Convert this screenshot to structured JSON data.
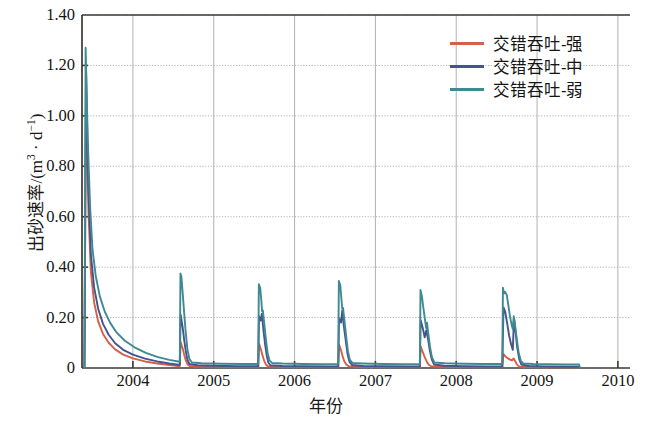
{
  "chart_data": {
    "type": "line",
    "title": "",
    "xlabel": "年份",
    "ylabel": "出砂速率/(m³ · d⁻¹)",
    "ylabel_parts": {
      "name": "出砂速率",
      "slash": "/(m",
      "sup1": "3",
      "mid": " · d",
      "sup2": "−1",
      "close": ")"
    },
    "xlim": [
      2003.37,
      2010.15
    ],
    "ylim": [
      0,
      1.4
    ],
    "yticks": [
      0,
      0.2,
      0.4,
      0.6,
      0.8,
      1.0,
      1.2,
      1.4
    ],
    "ytick_labels": [
      "0",
      "0.20",
      "0.40",
      "0.60",
      "0.80",
      "1.00",
      "1.20",
      "1.40"
    ],
    "xticks": [
      2004,
      2005,
      2006,
      2007,
      2008,
      2009,
      2010
    ],
    "xtick_labels": [
      "2004",
      "2005",
      "2006",
      "2007",
      "2008",
      "2009",
      "2010"
    ],
    "grid": true,
    "grid_color": "#a8a8a8",
    "legend_position": "top-right",
    "colors": {
      "strong": "#d4604a",
      "medium": "#45548c",
      "weak": "#3f8a92"
    },
    "series": [
      {
        "name": "交错吞吐-强",
        "color": "#d4604a",
        "points": [
          [
            2003.4,
            0.0
          ],
          [
            2003.42,
            1.1
          ],
          [
            2003.45,
            0.62
          ],
          [
            2003.48,
            0.38
          ],
          [
            2003.52,
            0.26
          ],
          [
            2003.57,
            0.185
          ],
          [
            2003.63,
            0.135
          ],
          [
            2003.7,
            0.1
          ],
          [
            2003.78,
            0.074
          ],
          [
            2003.88,
            0.053
          ],
          [
            2004.0,
            0.038
          ],
          [
            2004.15,
            0.026
          ],
          [
            2004.3,
            0.018
          ],
          [
            2004.45,
            0.012
          ],
          [
            2004.56,
            0.008
          ],
          [
            2004.58,
            0.008
          ],
          [
            2004.59,
            0.103
          ],
          [
            2004.615,
            0.078
          ],
          [
            2004.635,
            0.052
          ],
          [
            2004.655,
            0.03
          ],
          [
            2004.675,
            0.015
          ],
          [
            2004.7,
            0.008
          ],
          [
            2004.8,
            0.006
          ],
          [
            2005.0,
            0.005
          ],
          [
            2005.3,
            0.004
          ],
          [
            2005.53,
            0.004
          ],
          [
            2005.55,
            0.004
          ],
          [
            2005.56,
            0.096
          ],
          [
            2005.585,
            0.072
          ],
          [
            2005.605,
            0.048
          ],
          [
            2005.625,
            0.028
          ],
          [
            2005.645,
            0.014
          ],
          [
            2005.67,
            0.007
          ],
          [
            2005.8,
            0.005
          ],
          [
            2006.1,
            0.004
          ],
          [
            2006.4,
            0.004
          ],
          [
            2006.52,
            0.004
          ],
          [
            2006.54,
            0.004
          ],
          [
            2006.55,
            0.092
          ],
          [
            2006.575,
            0.07
          ],
          [
            2006.595,
            0.046
          ],
          [
            2006.615,
            0.027
          ],
          [
            2006.64,
            0.014
          ],
          [
            2006.67,
            0.007
          ],
          [
            2006.8,
            0.005
          ],
          [
            2007.1,
            0.004
          ],
          [
            2007.4,
            0.004
          ],
          [
            2007.53,
            0.004
          ],
          [
            2007.55,
            0.004
          ],
          [
            2007.56,
            0.085
          ],
          [
            2007.585,
            0.064
          ],
          [
            2007.61,
            0.043
          ],
          [
            2007.635,
            0.026
          ],
          [
            2007.66,
            0.013
          ],
          [
            2007.69,
            0.007
          ],
          [
            2007.85,
            0.005
          ],
          [
            2008.1,
            0.004
          ],
          [
            2008.4,
            0.004
          ],
          [
            2008.55,
            0.004
          ],
          [
            2008.57,
            0.004
          ],
          [
            2008.585,
            0.055
          ],
          [
            2008.61,
            0.046
          ],
          [
            2008.64,
            0.038
          ],
          [
            2008.665,
            0.033
          ],
          [
            2008.69,
            0.03
          ],
          [
            2008.71,
            0.038
          ],
          [
            2008.725,
            0.03
          ],
          [
            2008.745,
            0.018
          ],
          [
            2008.765,
            0.009
          ],
          [
            2008.79,
            0.005
          ],
          [
            2008.9,
            0.004
          ],
          [
            2009.1,
            0.003
          ],
          [
            2009.4,
            0.003
          ],
          [
            2009.52,
            0.003
          ],
          [
            2009.53,
            0.0
          ]
        ]
      },
      {
        "name": "交错吞吐-中",
        "color": "#45548c",
        "points": [
          [
            2003.4,
            0.0
          ],
          [
            2003.42,
            1.18
          ],
          [
            2003.45,
            0.7
          ],
          [
            2003.48,
            0.45
          ],
          [
            2003.52,
            0.32
          ],
          [
            2003.57,
            0.235
          ],
          [
            2003.63,
            0.175
          ],
          [
            2003.7,
            0.132
          ],
          [
            2003.78,
            0.098
          ],
          [
            2003.88,
            0.072
          ],
          [
            2004.0,
            0.053
          ],
          [
            2004.15,
            0.037
          ],
          [
            2004.3,
            0.026
          ],
          [
            2004.45,
            0.018
          ],
          [
            2004.56,
            0.013
          ],
          [
            2004.58,
            0.013
          ],
          [
            2004.59,
            0.212
          ],
          [
            2004.615,
            0.162
          ],
          [
            2004.635,
            0.11
          ],
          [
            2004.655,
            0.065
          ],
          [
            2004.675,
            0.032
          ],
          [
            2004.7,
            0.016
          ],
          [
            2004.8,
            0.011
          ],
          [
            2005.0,
            0.009
          ],
          [
            2005.3,
            0.007
          ],
          [
            2005.53,
            0.007
          ],
          [
            2005.55,
            0.007
          ],
          [
            2005.56,
            0.205
          ],
          [
            2005.58,
            0.188
          ],
          [
            2005.595,
            0.215
          ],
          [
            2005.615,
            0.15
          ],
          [
            2005.635,
            0.095
          ],
          [
            2005.655,
            0.05
          ],
          [
            2005.675,
            0.022
          ],
          [
            2005.7,
            0.011
          ],
          [
            2005.85,
            0.008
          ],
          [
            2006.1,
            0.007
          ],
          [
            2006.4,
            0.006
          ],
          [
            2006.52,
            0.006
          ],
          [
            2006.54,
            0.006
          ],
          [
            2006.55,
            0.198
          ],
          [
            2006.575,
            0.18
          ],
          [
            2006.59,
            0.228
          ],
          [
            2006.61,
            0.165
          ],
          [
            2006.635,
            0.105
          ],
          [
            2006.655,
            0.055
          ],
          [
            2006.68,
            0.024
          ],
          [
            2006.71,
            0.012
          ],
          [
            2006.85,
            0.008
          ],
          [
            2007.1,
            0.007
          ],
          [
            2007.4,
            0.006
          ],
          [
            2007.53,
            0.006
          ],
          [
            2007.55,
            0.006
          ],
          [
            2007.56,
            0.19
          ],
          [
            2007.585,
            0.16
          ],
          [
            2007.61,
            0.122
          ],
          [
            2007.63,
            0.15
          ],
          [
            2007.655,
            0.108
          ],
          [
            2007.675,
            0.066
          ],
          [
            2007.7,
            0.032
          ],
          [
            2007.725,
            0.014
          ],
          [
            2007.85,
            0.009
          ],
          [
            2008.1,
            0.007
          ],
          [
            2008.4,
            0.006
          ],
          [
            2008.55,
            0.006
          ],
          [
            2008.57,
            0.006
          ],
          [
            2008.585,
            0.24
          ],
          [
            2008.605,
            0.225
          ],
          [
            2008.63,
            0.178
          ],
          [
            2008.655,
            0.128
          ],
          [
            2008.68,
            0.092
          ],
          [
            2008.7,
            0.072
          ],
          [
            2008.715,
            0.198
          ],
          [
            2008.735,
            0.14
          ],
          [
            2008.755,
            0.08
          ],
          [
            2008.78,
            0.034
          ],
          [
            2008.805,
            0.014
          ],
          [
            2008.9,
            0.008
          ],
          [
            2009.1,
            0.006
          ],
          [
            2009.4,
            0.005
          ],
          [
            2009.52,
            0.005
          ],
          [
            2009.53,
            0.0
          ]
        ]
      },
      {
        "name": "交错吞吐-弱",
        "color": "#3f8a92",
        "points": [
          [
            2003.4,
            0.0
          ],
          [
            2003.415,
            1.27
          ],
          [
            2003.44,
            0.92
          ],
          [
            2003.47,
            0.64
          ],
          [
            2003.5,
            0.47
          ],
          [
            2003.54,
            0.365
          ],
          [
            2003.59,
            0.285
          ],
          [
            2003.65,
            0.225
          ],
          [
            2003.72,
            0.178
          ],
          [
            2003.8,
            0.14
          ],
          [
            2003.9,
            0.108
          ],
          [
            2004.02,
            0.082
          ],
          [
            2004.16,
            0.06
          ],
          [
            2004.3,
            0.044
          ],
          [
            2004.45,
            0.032
          ],
          [
            2004.56,
            0.026
          ],
          [
            2004.58,
            0.026
          ],
          [
            2004.588,
            0.375
          ],
          [
            2004.6,
            0.362
          ],
          [
            2004.615,
            0.3
          ],
          [
            2004.635,
            0.215
          ],
          [
            2004.655,
            0.135
          ],
          [
            2004.675,
            0.072
          ],
          [
            2004.7,
            0.035
          ],
          [
            2004.73,
            0.022
          ],
          [
            2004.85,
            0.019
          ],
          [
            2005.1,
            0.017
          ],
          [
            2005.35,
            0.016
          ],
          [
            2005.53,
            0.016
          ],
          [
            2005.55,
            0.016
          ],
          [
            2005.558,
            0.332
          ],
          [
            2005.575,
            0.318
          ],
          [
            2005.59,
            0.262
          ],
          [
            2005.598,
            0.225
          ],
          [
            2005.608,
            0.228
          ],
          [
            2005.625,
            0.175
          ],
          [
            2005.645,
            0.115
          ],
          [
            2005.665,
            0.062
          ],
          [
            2005.69,
            0.03
          ],
          [
            2005.72,
            0.02
          ],
          [
            2005.85,
            0.018
          ],
          [
            2006.1,
            0.016
          ],
          [
            2006.35,
            0.015
          ],
          [
            2006.52,
            0.015
          ],
          [
            2006.54,
            0.015
          ],
          [
            2006.548,
            0.345
          ],
          [
            2006.565,
            0.33
          ],
          [
            2006.58,
            0.272
          ],
          [
            2006.59,
            0.235
          ],
          [
            2006.6,
            0.238
          ],
          [
            2006.618,
            0.185
          ],
          [
            2006.64,
            0.122
          ],
          [
            2006.66,
            0.066
          ],
          [
            2006.685,
            0.032
          ],
          [
            2006.715,
            0.02
          ],
          [
            2006.85,
            0.018
          ],
          [
            2007.1,
            0.016
          ],
          [
            2007.35,
            0.015
          ],
          [
            2007.53,
            0.015
          ],
          [
            2007.55,
            0.015
          ],
          [
            2007.558,
            0.31
          ],
          [
            2007.575,
            0.285
          ],
          [
            2007.595,
            0.235
          ],
          [
            2007.615,
            0.188
          ],
          [
            2007.628,
            0.158
          ],
          [
            2007.638,
            0.18
          ],
          [
            2007.655,
            0.135
          ],
          [
            2007.675,
            0.085
          ],
          [
            2007.7,
            0.042
          ],
          [
            2007.73,
            0.022
          ],
          [
            2007.86,
            0.019
          ],
          [
            2008.1,
            0.017
          ],
          [
            2008.35,
            0.016
          ],
          [
            2008.55,
            0.016
          ],
          [
            2008.57,
            0.016
          ],
          [
            2008.578,
            0.318
          ],
          [
            2008.592,
            0.296
          ],
          [
            2008.605,
            0.302
          ],
          [
            2008.625,
            0.29
          ],
          [
            2008.645,
            0.248
          ],
          [
            2008.665,
            0.205
          ],
          [
            2008.685,
            0.172
          ],
          [
            2008.7,
            0.155
          ],
          [
            2008.712,
            0.205
          ],
          [
            2008.728,
            0.17
          ],
          [
            2008.748,
            0.118
          ],
          [
            2008.772,
            0.062
          ],
          [
            2008.8,
            0.028
          ],
          [
            2008.83,
            0.018
          ],
          [
            2008.95,
            0.016
          ],
          [
            2009.15,
            0.015
          ],
          [
            2009.35,
            0.014
          ],
          [
            2009.52,
            0.014
          ],
          [
            2009.53,
            0.0
          ]
        ]
      }
    ]
  },
  "legend": {
    "entries": [
      {
        "label": "交错吞吐-强",
        "color": "#d4604a"
      },
      {
        "label": "交错吞吐-中",
        "color": "#45548c"
      },
      {
        "label": "交错吞吐-弱",
        "color": "#3f8a92"
      }
    ]
  },
  "axes": {
    "ylabel_text": "出砂速率/(m3 · d-1)",
    "xlabel_text": "年份"
  }
}
